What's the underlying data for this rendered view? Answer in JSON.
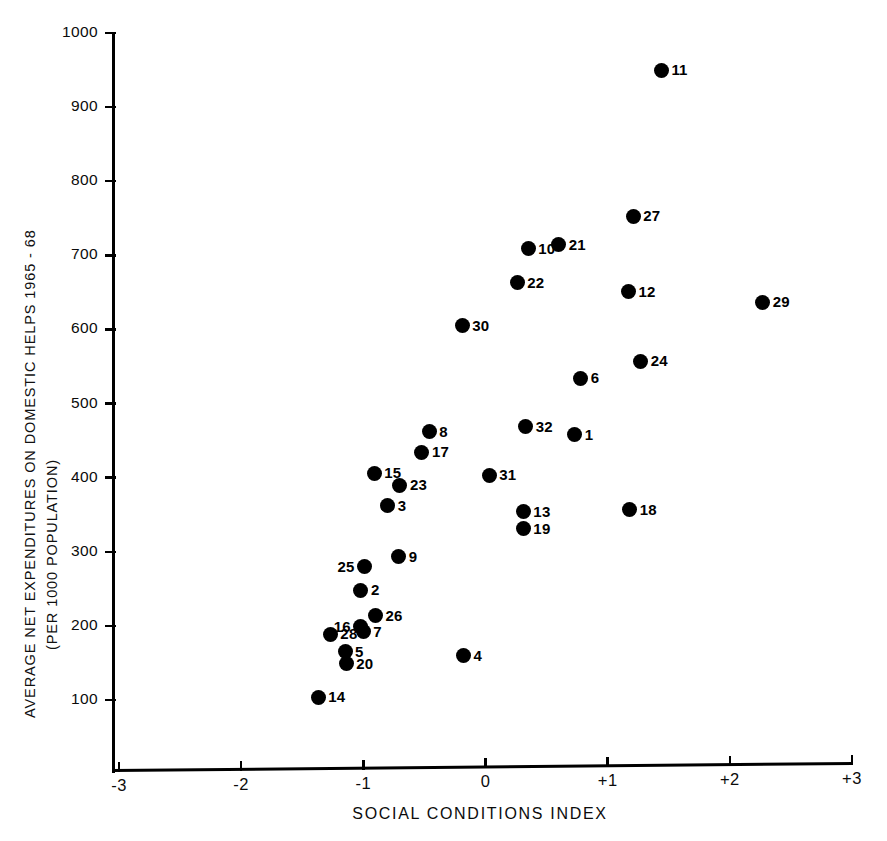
{
  "chart_data": {
    "type": "scatter",
    "title": "",
    "xlabel": "SOCIAL CONDITIONS INDEX",
    "ylabel": "AVERAGE NET EXPENDITURES ON DOMESTIC HELPS 1965 - 68 (PER 1000 POPULATION)",
    "ylabel_line1": "AVERAGE NET EXPENDITURES ON DOMESTIC HELPS 1965 - 68",
    "ylabel_line2": "(PER 1000 POPULATION)",
    "xlim": [
      -3,
      3
    ],
    "ylim": [
      0,
      1000
    ],
    "xticks": [
      -3,
      -2,
      -1,
      0,
      1,
      2,
      3
    ],
    "xtick_labels": [
      "-3",
      "-2",
      "-1",
      "0",
      "+1",
      "+2",
      "+3"
    ],
    "yticks": [
      100,
      200,
      300,
      400,
      500,
      600,
      700,
      800,
      900,
      1000
    ],
    "ytick_labels": [
      "100",
      "200",
      "300",
      "400",
      "500",
      "600",
      "700",
      "800",
      "900",
      "1000"
    ],
    "grid": false,
    "legend": "none",
    "marker_color": "#000000",
    "axis_color": "#000000",
    "points": [
      {
        "label": "1",
        "x": 0.73,
        "y": 458,
        "label_pos": "right"
      },
      {
        "label": "2",
        "x": -1.02,
        "y": 248,
        "label_pos": "right"
      },
      {
        "label": "3",
        "x": -0.8,
        "y": 362,
        "label_pos": "right"
      },
      {
        "label": "4",
        "x": -0.18,
        "y": 160,
        "label_pos": "right"
      },
      {
        "label": "5",
        "x": -1.15,
        "y": 165,
        "label_pos": "right"
      },
      {
        "label": "6",
        "x": 0.78,
        "y": 534,
        "label_pos": "right"
      },
      {
        "label": "7",
        "x": -1.0,
        "y": 192,
        "label_pos": "right"
      },
      {
        "label": "8",
        "x": -0.46,
        "y": 462,
        "label_pos": "right"
      },
      {
        "label": "9",
        "x": -0.71,
        "y": 293,
        "label_pos": "right"
      },
      {
        "label": "10",
        "x": 0.35,
        "y": 709,
        "label_pos": "right"
      },
      {
        "label": "11",
        "x": 1.44,
        "y": 950,
        "label_pos": "right"
      },
      {
        "label": "12",
        "x": 1.17,
        "y": 651,
        "label_pos": "right"
      },
      {
        "label": "13",
        "x": 0.31,
        "y": 354,
        "label_pos": "right"
      },
      {
        "label": "14",
        "x": -1.37,
        "y": 104,
        "label_pos": "right"
      },
      {
        "label": "15",
        "x": -0.91,
        "y": 406,
        "label_pos": "right"
      },
      {
        "label": "16",
        "x": -1.02,
        "y": 199,
        "label_pos": "left"
      },
      {
        "label": "17",
        "x": -0.52,
        "y": 434,
        "label_pos": "right"
      },
      {
        "label": "18",
        "x": 1.18,
        "y": 357,
        "label_pos": "right"
      },
      {
        "label": "19",
        "x": 0.31,
        "y": 331,
        "label_pos": "right"
      },
      {
        "label": "20",
        "x": -1.14,
        "y": 149,
        "label_pos": "right"
      },
      {
        "label": "21",
        "x": 0.6,
        "y": 714,
        "label_pos": "right"
      },
      {
        "label": "22",
        "x": 0.26,
        "y": 663,
        "label_pos": "right"
      },
      {
        "label": "23",
        "x": -0.7,
        "y": 390,
        "label_pos": "right"
      },
      {
        "label": "24",
        "x": 1.27,
        "y": 557,
        "label_pos": "right"
      },
      {
        "label": "25",
        "x": -0.99,
        "y": 280,
        "label_pos": "left"
      },
      {
        "label": "26",
        "x": -0.9,
        "y": 214,
        "label_pos": "right"
      },
      {
        "label": "27",
        "x": 1.21,
        "y": 753,
        "label_pos": "right"
      },
      {
        "label": "28",
        "x": -1.27,
        "y": 189,
        "label_pos": "right"
      },
      {
        "label": "29",
        "x": 2.27,
        "y": 637,
        "label_pos": "right"
      },
      {
        "label": "30",
        "x": -0.19,
        "y": 605,
        "label_pos": "right"
      },
      {
        "label": "31",
        "x": 0.03,
        "y": 403,
        "label_pos": "right"
      },
      {
        "label": "32",
        "x": 0.33,
        "y": 469,
        "label_pos": "right"
      }
    ]
  }
}
